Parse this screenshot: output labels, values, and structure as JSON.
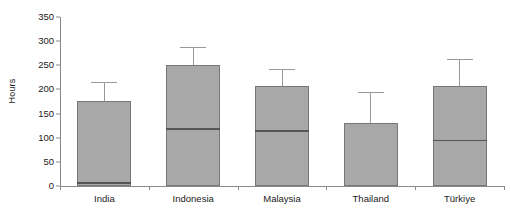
{
  "chart_data": {
    "type": "box",
    "title": "",
    "xlabel": "",
    "ylabel": "Hours",
    "ylim": [
      0,
      350
    ],
    "yticks": [
      0,
      50,
      100,
      150,
      200,
      250,
      300,
      350
    ],
    "ytick_labels": [
      "0",
      "50",
      "100",
      "150",
      "200",
      "250",
      "300",
      "350"
    ],
    "grid": false,
    "legend": "none",
    "categories": [
      "India",
      "Indonesia",
      "Malaysia",
      "Thailand",
      "Türkiye"
    ],
    "boxes": [
      {
        "category": "India",
        "q1": 0,
        "median": 8,
        "q3": 176,
        "whisker_low": 0,
        "whisker_high": 215
      },
      {
        "category": "Indonesia",
        "q1": 0,
        "median": 120,
        "q3": 250,
        "whisker_low": 0,
        "whisker_high": 287
      },
      {
        "category": "Malaysia",
        "q1": 0,
        "median": 115,
        "q3": 208,
        "whisker_low": 0,
        "whisker_high": 243
      },
      {
        "category": "Thailand",
        "q1": 0,
        "median": 0,
        "q3": 130,
        "whisker_low": 0,
        "whisker_high": 195
      },
      {
        "category": "Türkiye",
        "q1": 0,
        "median": 96,
        "q3": 207,
        "whisker_low": 0,
        "whisker_high": 262
      }
    ],
    "colors": {
      "box_fill": "#a8a8a8",
      "box_edge": "#777777",
      "median_line": "#555555",
      "whisker": "#9a9a9a",
      "axis": "#8a8a8a",
      "text": "#1a1a1a",
      "background": "#ffffff"
    }
  },
  "layout": {
    "plot_left": 60,
    "plot_right": 504,
    "plot_top": 17,
    "plot_bottom": 186
  }
}
